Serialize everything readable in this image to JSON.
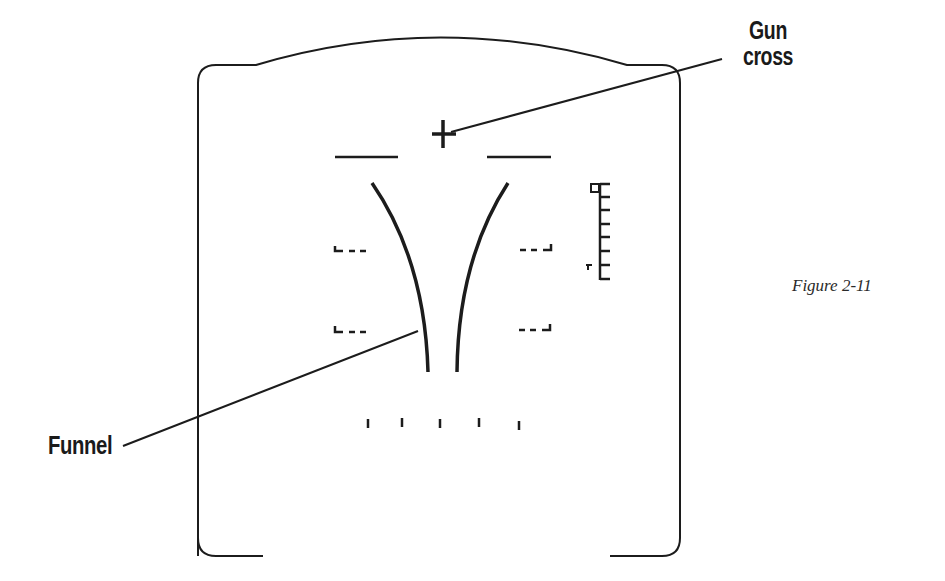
{
  "figure": {
    "caption": "Figure 2-11"
  },
  "labels": {
    "gun_cross_line1": "Gun",
    "gun_cross_line2": "cross",
    "funnel": "Funnel"
  },
  "symbols": {
    "gun_cross": {
      "cx": 443,
      "cy": 134,
      "arm": 11
    },
    "horizon_bars": [
      {
        "x1": 335,
        "x2": 398,
        "y": 157
      },
      {
        "x1": 487,
        "x2": 551,
        "y": 157
      }
    ],
    "funnel_left": {
      "top": [
        372,
        183
      ],
      "bottom": [
        428,
        372
      ]
    },
    "funnel_right": {
      "top": [
        508,
        183
      ],
      "bottom": [
        457,
        372
      ]
    },
    "pitch_brackets_left": [
      {
        "x": 335,
        "y": 250
      },
      {
        "x": 335,
        "y": 331
      }
    ],
    "pitch_brackets_right": [
      {
        "x": 551,
        "y": 250
      },
      {
        "x": 551,
        "y": 330
      }
    ],
    "range_scale": {
      "x": 600,
      "y_top": 184,
      "y_bottom": 280,
      "ticks": 8
    },
    "range_ticks_bottom": [
      368,
      402,
      440,
      479,
      519
    ]
  },
  "colors": {
    "ink": "#1c1c1c",
    "background": "#ffffff"
  }
}
